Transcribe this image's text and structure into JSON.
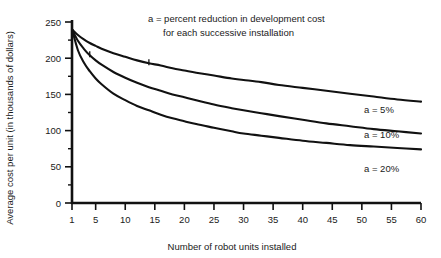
{
  "chart_data": {
    "type": "line",
    "title": "",
    "xlabel": "Number of robot units installed",
    "ylabel": "Average cost per unit (in thousands of dollars)",
    "xlim": [
      1,
      60
    ],
    "ylim": [
      0,
      250
    ],
    "grid": false,
    "legend_position": "right-inline",
    "xticks": [
      1,
      5,
      10,
      15,
      20,
      25,
      30,
      35,
      40,
      45,
      50,
      55,
      60
    ],
    "xticklabels": [
      "1",
      "5",
      "10",
      "15",
      "20",
      "25",
      "30",
      "35",
      "40",
      "45",
      "50",
      "55",
      "60"
    ],
    "yticks": [
      0,
      50,
      100,
      150,
      200,
      250
    ],
    "yticklabels": [
      "0",
      "50",
      "100",
      "150",
      "200",
      "250"
    ],
    "yminorticks": [
      25,
      75,
      125,
      175,
      225
    ],
    "annotations": [
      "a  =  percent reduction in development cost",
      "for each successive installation"
    ],
    "x": [
      1,
      2,
      3,
      4,
      5,
      6,
      8,
      10,
      12,
      14,
      16,
      18,
      20,
      22,
      25,
      28,
      30,
      33,
      36,
      40,
      44,
      48,
      52,
      56,
      60
    ],
    "series": [
      {
        "name": "a = 5%",
        "label": "a  =  5%",
        "values": [
          240,
          232,
          226,
          221,
          217,
          213,
          207,
          202,
          197,
          193,
          190,
          186,
          183,
          180,
          176,
          172,
          170,
          167,
          163,
          159,
          155,
          151,
          147,
          143,
          140
        ]
      },
      {
        "name": "a = 10%",
        "label": "a  =  10%",
        "values": [
          240,
          224,
          213,
          204,
          197,
          191,
          181,
          173,
          166,
          160,
          155,
          150,
          146,
          142,
          136,
          131,
          128,
          124,
          120,
          115,
          110,
          106,
          102,
          99,
          96
        ]
      },
      {
        "name": "a = 20%",
        "label": "a  =  20%",
        "values": [
          240,
          211,
          194,
          182,
          172,
          164,
          151,
          142,
          134,
          128,
          122,
          117,
          113,
          109,
          104,
          99,
          96,
          93,
          90,
          86,
          83,
          80,
          78,
          76,
          74
        ]
      }
    ]
  },
  "axis": {
    "y_title": "Average cost per unit (in thousands of dollars)",
    "x_title": "Number of robot units installed"
  },
  "note": {
    "line1": "a  =  percent reduction in development cost",
    "line2": "for each successive installation"
  },
  "labels": {
    "a5": "a  =  5%",
    "a10": "a  =  10%",
    "a20": "a  =  20%"
  },
  "colors": {
    "ink": "#111111",
    "background": "#ffffff"
  }
}
